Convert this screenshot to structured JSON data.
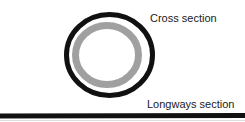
{
  "diagram": {
    "labels": {
      "cross_section": "Cross section",
      "longways_section": "Longways section"
    },
    "colors": {
      "outer_ring": "#111111",
      "inner_ring": "#a0a0a0",
      "baseline": "#111111",
      "background": "#ffffff"
    }
  }
}
